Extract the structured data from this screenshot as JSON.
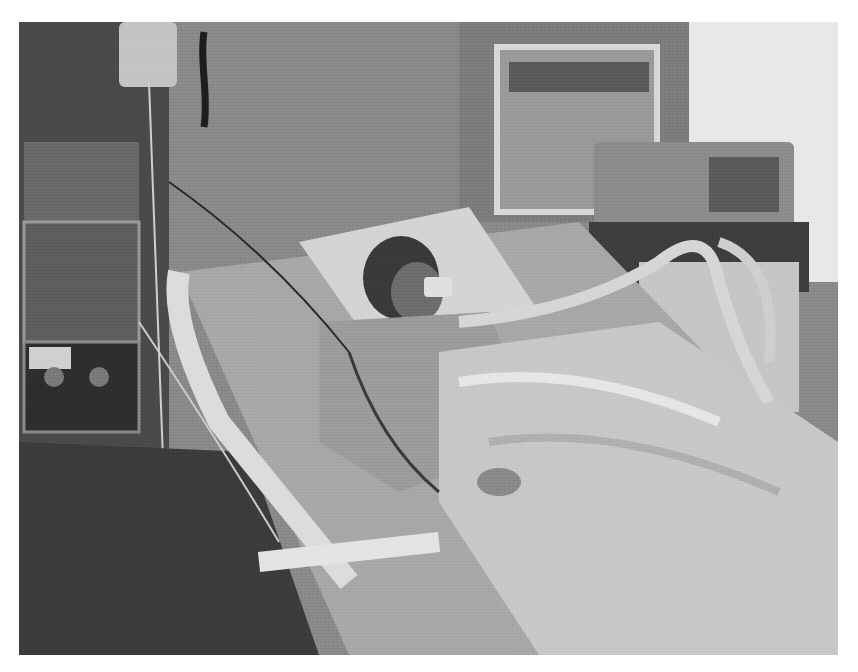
{
  "image": {
    "kind": "grayscale photograph",
    "scene": "hospital intensive care unit",
    "description": "Child lying in a hospital bed with breathing tube, covered by a white blanket, connected to ventilator tubing and monitoring wires; IV pumps on a pole at left, ventilator machine at upper right, wall panel behind",
    "colors": {
      "background": "#ffffff",
      "wall": "#8a8a8a",
      "floor": "#3c3c3c",
      "sheet": "#c8c8c8",
      "equipment_dark": "#2e2e2e"
    }
  }
}
